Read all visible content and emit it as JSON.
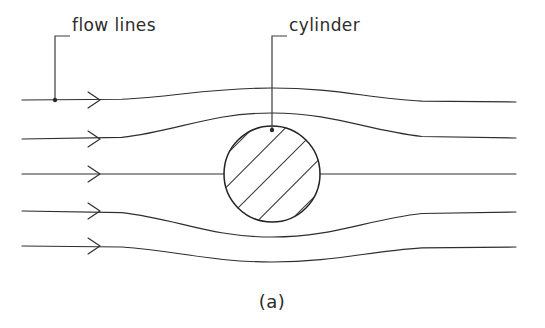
{
  "figure": {
    "caption": "(a)",
    "background_color": "#ffffff",
    "ink_color": "#2e2e2e",
    "width": 545,
    "height": 328
  },
  "labels": {
    "flow_lines": {
      "text": "flow lines",
      "x": 72,
      "y": 31,
      "leader_horizontal_y": 36,
      "leader_horizontal_x1": 55,
      "leader_horizontal_x2": 70,
      "leader_vertical_x": 55,
      "leader_vertical_y1": 36,
      "leader_vertical_y2": 100
    },
    "cylinder": {
      "text": "cylinder",
      "x": 289,
      "y": 31,
      "leader_horizontal_y": 36,
      "leader_horizontal_x1": 272,
      "leader_horizontal_x2": 287,
      "leader_vertical_x": 272,
      "leader_vertical_y1": 36,
      "leader_vertical_y2": 130
    }
  },
  "cylinder_shape": {
    "center_x": 272,
    "center_y": 174,
    "radius": 48,
    "hatch_count": 5,
    "hatch_angle_degrees": 45,
    "hatch_offsets": [
      -46,
      -23,
      0,
      23,
      46
    ]
  },
  "streamlines": [
    {
      "name": "streamline-1",
      "left_y": 100,
      "right_y": 102,
      "deflection": "up",
      "crest_y": 88,
      "interrupted": false,
      "arrow_x": 97,
      "x_start": 22,
      "x_end": 516
    },
    {
      "name": "streamline-2",
      "left_y": 139,
      "right_y": 138,
      "deflection": "up",
      "crest_y": 113,
      "interrupted": false,
      "arrow_x": 97,
      "x_start": 22,
      "x_end": 516
    },
    {
      "name": "streamline-3",
      "left_y": 174,
      "right_y": 174,
      "deflection": "none",
      "crest_y": 174,
      "interrupted": true,
      "arrow_x": 97,
      "x_start": 22,
      "x_end": 516
    },
    {
      "name": "streamline-4",
      "left_y": 211,
      "right_y": 212,
      "deflection": "down",
      "crest_y": 237,
      "interrupted": false,
      "arrow_x": 97,
      "x_start": 22,
      "x_end": 516
    },
    {
      "name": "streamline-5",
      "left_y": 246,
      "right_y": 247,
      "deflection": "down",
      "crest_y": 262,
      "interrupted": false,
      "arrow_x": 97,
      "x_start": 22,
      "x_end": 516
    }
  ],
  "caption_position": {
    "x": 272,
    "y": 308
  }
}
